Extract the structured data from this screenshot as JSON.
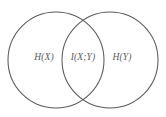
{
  "figure": {
    "type": "venn-diagram",
    "background_color": "#ffffff",
    "stroke_color": "#59595c",
    "text_color": "#5b5b5e",
    "width": 166,
    "height": 117,
    "labels": {
      "left": "H(X)",
      "center": "I(X;Y)",
      "right": "H(Y)"
    },
    "sets": [
      {
        "name": "left-circle",
        "label": "H(X)",
        "cx": 56,
        "cy": 60,
        "r": 48
      },
      {
        "name": "right-circle",
        "label": "H(Y)",
        "cx": 110,
        "cy": 60,
        "r": 48
      }
    ],
    "intersection": {
      "name": "mutual-information-lens",
      "label": "I(X;Y)"
    }
  }
}
